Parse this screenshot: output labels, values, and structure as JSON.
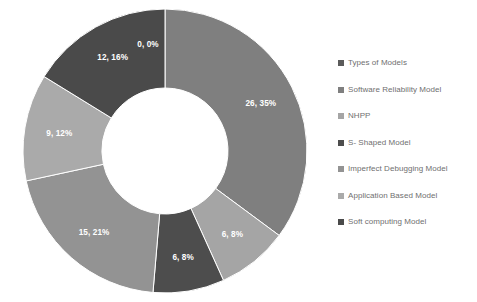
{
  "chart_data": {
    "type": "pie",
    "variant": "doughnut",
    "title": "",
    "xlabel": "",
    "ylabel": "",
    "grid": false,
    "legend_position": "right",
    "label_format": "value, percent",
    "total": 74,
    "categories": [
      "Types of Models",
      "Software Reliability Model",
      "NHPP",
      "S- Shaped Model",
      "Imperfect Debugging Model",
      "Application Based Model",
      "Soft computing Model"
    ],
    "values": [
      0,
      26,
      6,
      6,
      15,
      9,
      12
    ],
    "percents": [
      0,
      35,
      8,
      8,
      21,
      12,
      16
    ],
    "data_labels": [
      "0, 0%",
      "26, 35%",
      "6, 8%",
      "6, 8%",
      "15, 21%",
      "9, 12%",
      "12, 16%"
    ],
    "colors": [
      "#5b5b5b",
      "#7f7f7f",
      "#a5a5a5",
      "#4d4d4d",
      "#939393",
      "#aaaaaa",
      "#4a4a4a"
    ],
    "slices": [
      {
        "label": "Types of Models",
        "value": 0,
        "percent": 0,
        "data_label": "0, 0%",
        "color": "#5b5b5b"
      },
      {
        "label": "Software Reliability Model",
        "value": 26,
        "percent": 35,
        "data_label": "26, 35%",
        "color": "#7f7f7f"
      },
      {
        "label": "NHPP",
        "value": 6,
        "percent": 8,
        "data_label": "6, 8%",
        "color": "#a5a5a5"
      },
      {
        "label": "S- Shaped Model",
        "value": 6,
        "percent": 8,
        "data_label": "6, 8%",
        "color": "#4d4d4d"
      },
      {
        "label": "Imperfect Debugging Model",
        "value": 15,
        "percent": 21,
        "data_label": "15, 21%",
        "color": "#939393"
      },
      {
        "label": "Application Based Model",
        "value": 9,
        "percent": 12,
        "data_label": "9, 12%",
        "color": "#aaaaaa"
      },
      {
        "label": "Soft computing Model",
        "value": 12,
        "percent": 16,
        "data_label": "12, 16%",
        "color": "#4a4a4a"
      }
    ]
  },
  "legend": {
    "items": [
      {
        "label": "Types of Models",
        "color": "#5b5b5b"
      },
      {
        "label": "Software Reliability Model",
        "color": "#7f7f7f"
      },
      {
        "label": "NHPP",
        "color": "#a5a5a5"
      },
      {
        "label": "S- Shaped Model",
        "color": "#4d4d4d"
      },
      {
        "label": "Imperfect Debugging Model",
        "color": "#939393"
      },
      {
        "label": "Application Based Model",
        "color": "#aaaaaa"
      },
      {
        "label": "Soft computing Model",
        "color": "#4a4a4a"
      }
    ]
  }
}
